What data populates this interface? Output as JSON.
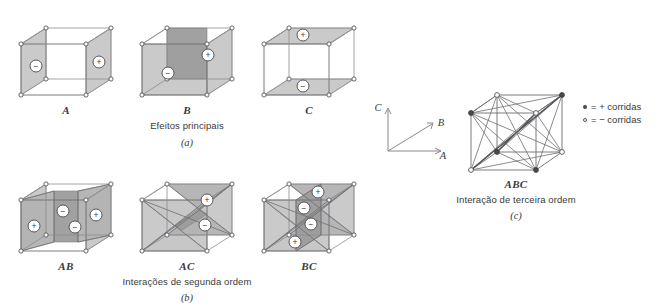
{
  "figure": {
    "top_fragment": "        ",
    "background_color": "#ffffff",
    "ink_color": "#4a4a4a",
    "face_light": "#c6c6c6",
    "face_mid": "#b0b0b0",
    "face_dark": "#9a9a9a"
  },
  "panel_a": {
    "cubes": [
      {
        "label": "A",
        "signs": [
          "−",
          "+"
        ]
      },
      {
        "label": "B",
        "signs": [
          "−",
          "+"
        ]
      },
      {
        "label": "C",
        "signs": [
          "+",
          "−"
        ]
      }
    ],
    "caption": "Efeitos principais",
    "panel_letter": "(a)"
  },
  "panel_b": {
    "cubes": [
      {
        "label": "AB",
        "signs": [
          "+",
          "−",
          "−",
          "+"
        ]
      },
      {
        "label": "AC",
        "signs": [
          "+",
          "−"
        ]
      },
      {
        "label": "BC",
        "signs": [
          "+",
          "−",
          "−",
          "+"
        ]
      }
    ],
    "caption": "Interações de segunda ordem",
    "panel_letter": "(b)"
  },
  "panel_c": {
    "cube": {
      "label": "ABC"
    },
    "caption": "Interação de terceira ordem",
    "panel_letter": "(c)"
  },
  "axes": {
    "x_label": "A",
    "y_label": "C",
    "depth_label": "B"
  },
  "legend": {
    "rows": [
      {
        "marker": "filled",
        "text": "= + corridas"
      },
      {
        "marker": "open",
        "text": "= − corridas"
      }
    ]
  },
  "sign_glyphs": {
    "plus": "+",
    "minus": "−"
  }
}
